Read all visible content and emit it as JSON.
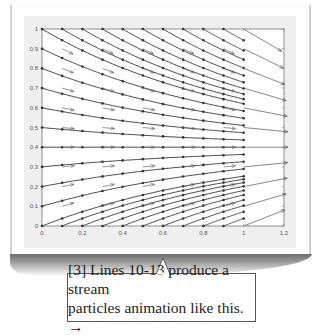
{
  "chart_data": {
    "type": "line",
    "subtype": "streamline-quiver",
    "title": "",
    "xlabel": "",
    "ylabel": "",
    "xlim": [
      0,
      1.2
    ],
    "ylim": [
      0,
      1
    ],
    "xticks": [
      "0",
      "0.2",
      "0.4",
      "0.6",
      "0.8",
      "1",
      "1.2"
    ],
    "yticks": [
      "0",
      "0.1",
      "0.2",
      "0.3",
      "0.4",
      "0.5",
      "0.6",
      "0.7",
      "0.8",
      "0.9",
      "1"
    ],
    "grid": false,
    "legend": null,
    "field": "u = 1, v = -(y - 0.4); streamlines y = 0.4 + (y0 - 0.4)·exp(-(x - x0))",
    "streamline_starts_left_edge_y": [
      0,
      0.1,
      0.2,
      0.3,
      0.4,
      0.5,
      0.6,
      0.7,
      0.8,
      0.9,
      1.0
    ],
    "streamline_starts_top_edge_x": [
      0.1,
      0.2,
      0.3,
      0.4,
      0.5,
      0.6,
      0.7,
      0.8,
      0.9
    ],
    "streamline_starts_bottom_edge_x": [
      0.1,
      0.2,
      0.3,
      0.4,
      0.5,
      0.6,
      0.7,
      0.8,
      0.9
    ],
    "streamline_x_end": 1.0,
    "quiver_interior_x": [
      0.1,
      0.3,
      0.5,
      0.7,
      0.9
    ],
    "quiver_interior_y": [
      0.1,
      0.2,
      0.3,
      0.4,
      0.5,
      0.6,
      0.7,
      0.8,
      0.9
    ],
    "quiver_edge_x": 1.0,
    "quiver_edge_y": [
      0,
      0.1,
      0.2,
      0.3,
      0.4,
      0.5,
      0.6,
      0.7,
      0.8,
      0.9,
      1.0
    ],
    "line_color": "#3a3a3a",
    "arrow_color": "#6a6a6a"
  },
  "callout": {
    "line1": "[3] Lines 10-13 produce a stream",
    "line2": "particles animation like this. →"
  }
}
